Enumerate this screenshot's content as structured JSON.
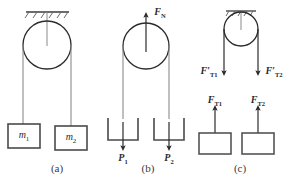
{
  "figure": {
    "width": 291,
    "height": 184,
    "background": "#ffffff",
    "stroke_color": "#3a3a3a",
    "text_color": "#2b2b2b"
  },
  "panels": [
    {
      "id": "a",
      "caption": "(a)",
      "caption_x": 57,
      "caption_y": 168,
      "description": "pulley fixed to ceiling with two hanging masses",
      "ceiling": {
        "x1": 26,
        "x2": 69,
        "y": 12,
        "hatch_count": 5
      },
      "pulley": {
        "cx": 47,
        "cy": 45,
        "r": 24
      },
      "ropes": [
        {
          "x": 23,
          "y1": 45,
          "y2": 124
        },
        {
          "x": 71,
          "y1": 45,
          "y2": 126
        }
      ],
      "blocks": [
        {
          "x": 8,
          "y": 124,
          "w": 32,
          "h": 24,
          "label": "m",
          "sub": "1"
        },
        {
          "x": 55,
          "y": 126,
          "w": 32,
          "h": 24,
          "label": "m",
          "sub": "2"
        }
      ]
    },
    {
      "id": "b",
      "caption": "(b)",
      "caption_x": 148,
      "caption_y": 168,
      "description": "free pulley with normal force and block weights",
      "pulley": {
        "cx": 146,
        "cy": 46,
        "r": 23
      },
      "ropes": [
        {
          "x": 123,
          "y1": 46,
          "y2": 118
        },
        {
          "x": 169,
          "y1": 46,
          "y2": 118
        }
      ],
      "blocks": [
        {
          "x": 108,
          "y": 118,
          "w": 30,
          "h": 22
        },
        {
          "x": 154,
          "y": 118,
          "w": 30,
          "h": 22
        }
      ],
      "forces": [
        {
          "name": "F",
          "sub": "N",
          "prime": false,
          "dir": "up",
          "x": 146,
          "tail_y": 46,
          "head_y": 14,
          "label_x": 158,
          "label_y": 12
        },
        {
          "name": "P",
          "sub": "1",
          "prime": false,
          "dir": "down",
          "x": 123,
          "tail_y": 123,
          "head_y": 147,
          "label_x": 123,
          "label_y": 157
        },
        {
          "name": "P",
          "sub": "2",
          "prime": false,
          "dir": "down",
          "x": 169,
          "tail_y": 123,
          "head_y": 147,
          "label_x": 169,
          "label_y": 157
        }
      ]
    },
    {
      "id": "c",
      "caption": "(c)",
      "caption_x": 240,
      "caption_y": 168,
      "description": "rope tension pairs on pulley and on blocks",
      "ceiling": {
        "x1": 226,
        "x2": 256,
        "y": 11,
        "hatch_count": 5
      },
      "pulley": {
        "cx": 241,
        "cy": 29,
        "r": 17
      },
      "forces_top": [
        {
          "name": "F",
          "sub": "T1",
          "prime": true,
          "dir": "down",
          "x": 224,
          "tail_y": 29,
          "head_y": 72,
          "label_x": 210,
          "label_y": 70
        },
        {
          "name": "F",
          "sub": "T2",
          "prime": true,
          "dir": "down",
          "x": 258,
          "tail_y": 29,
          "head_y": 72,
          "label_x": 273,
          "label_y": 70
        }
      ],
      "forces_bottom": [
        {
          "name": "F",
          "sub": "T1",
          "prime": false,
          "dir": "up",
          "x": 215,
          "tail_y": 142,
          "head_y": 109,
          "label_x": 215,
          "label_y": 100
        },
        {
          "name": "F",
          "sub": "T2",
          "prime": false,
          "dir": "up",
          "x": 258,
          "tail_y": 142,
          "head_y": 109,
          "label_x": 258,
          "label_y": 100
        }
      ],
      "blocks": [
        {
          "x": 199,
          "y": 133,
          "w": 32,
          "h": 21
        },
        {
          "x": 242,
          "y": 133,
          "w": 32,
          "h": 21
        }
      ]
    }
  ]
}
